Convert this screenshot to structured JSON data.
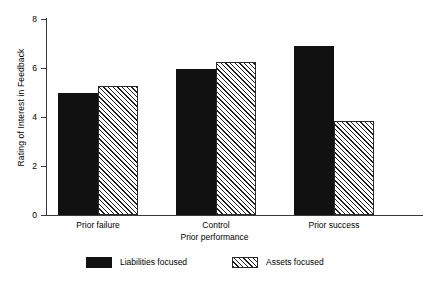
{
  "chart_data": {
    "type": "bar",
    "title": "",
    "subtitle": "",
    "xlabel": "Prior performance",
    "ylabel": "Rating of Interest in Feedback",
    "categories": [
      "Prior failure",
      "Control",
      "Prior success"
    ],
    "series": [
      {
        "name": "Liabilities focused",
        "fill": "solid-black",
        "values": [
          5.0,
          5.95,
          6.9
        ]
      },
      {
        "name": "Assets focused",
        "fill": "diagonal-hatch",
        "values": [
          5.25,
          6.25,
          3.85
        ]
      }
    ],
    "ylim": [
      0,
      8
    ],
    "yticks": [
      0,
      2,
      4,
      6,
      8
    ],
    "ytick_labels": [
      "0",
      "2",
      "4",
      "6",
      "8"
    ],
    "grid": false,
    "legend_position": "below-axes",
    "colors": {
      "series_1": "#111111",
      "series_2_line": "#1d1d1d",
      "series_2_background": "#ffffff",
      "axis": "#3a3a3a",
      "text": "#000000",
      "background": "#ffffff"
    }
  }
}
